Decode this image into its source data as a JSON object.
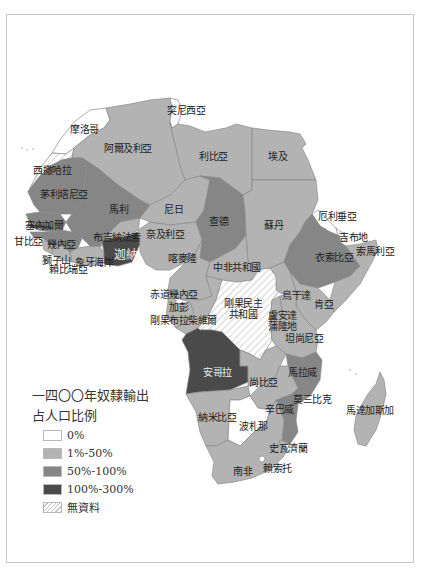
{
  "legend": {
    "title_line1": "一四〇〇年奴隸輸出",
    "title_line2": "占人口比例",
    "items": [
      {
        "label": "0%",
        "color": "#ffffff",
        "pattern": "none"
      },
      {
        "label": "1%-50%",
        "color": "#b3b3b3",
        "pattern": "none"
      },
      {
        "label": "50%-100%",
        "color": "#868686",
        "pattern": "none"
      },
      {
        "label": "100%-300%",
        "color": "#4a4a4a",
        "pattern": "none"
      },
      {
        "label": "無資料",
        "color": "#ffffff",
        "pattern": "hatch"
      }
    ]
  },
  "colors": {
    "c0": "#ffffff",
    "c1": "#b3b3b3",
    "c2": "#868686",
    "c3": "#4a4a4a",
    "border": "#8a8a8a",
    "hatch": "#c4c4c4"
  },
  "countries": {
    "tunisia": "突尼西亞",
    "morocco": "摩洛哥",
    "algeria": "阿爾及利亞",
    "libya": "利比亞",
    "egypt": "埃及",
    "western_sahara": "西撒哈拉",
    "mauritania": "茅利塔尼亞",
    "mali": "馬利",
    "niger": "尼日",
    "chad": "查德",
    "sudan": "蘇丹",
    "eritrea": "厄利垂亞",
    "djibouti": "吉布地",
    "ethiopia": "衣索比亞",
    "somalia": "索馬利亞",
    "senegal": "塞內加爾",
    "gambia": "甘比亞",
    "guinea": "幾內亞",
    "sierra_leone": "獅子山",
    "liberia": "賴比瑞亞",
    "cote_divoire": "象牙海岸",
    "burkina_faso": "布吉納法索",
    "ghana_togo_benin": "迦納",
    "nigeria": "奈及利亞",
    "cameroon": "喀麥隆",
    "central_african_republic": "中非共和國",
    "equatorial_guinea": "赤道幾內亞",
    "gabon": "加彭",
    "congo_brazzaville": "剛果布拉柴維爾",
    "drc_line1": "剛果民主",
    "drc_line2": "共和國",
    "uganda": "烏干達",
    "kenya": "肯亞",
    "rwanda_burundi_line1": "盧安達",
    "rwanda_burundi_line2": "蒲隆地",
    "tanzania": "坦尚尼亞",
    "angola": "安哥拉",
    "zambia": "尚比亞",
    "malawi": "馬拉威",
    "mozambique": "莫三比克",
    "zimbabwe": "辛巴威",
    "namibia": "納米比亞",
    "botswana": "波札那",
    "swaziland": "史瓦濟蘭",
    "lesotho": "賴索托",
    "south_africa": "南非",
    "madagascar": "馬達加斯加"
  }
}
